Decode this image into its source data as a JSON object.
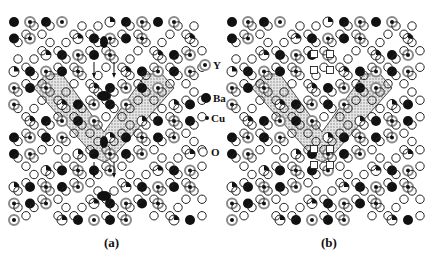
{
  "figure": {
    "panels": [
      {
        "id": "a",
        "caption": "(a)",
        "features": [
          "shaded-v-domain",
          "displacement-arrows",
          "elongated-ba-atoms"
        ]
      },
      {
        "id": "b",
        "caption": "(b)",
        "features": [
          "shaded-v-domain",
          "vacancy-square-markers"
        ]
      }
    ],
    "legend": [
      {
        "symbol": "ringed-dot",
        "label": "Y"
      },
      {
        "symbol": "filled-circle",
        "label": "Ba"
      },
      {
        "symbol": "small-dot",
        "label": "Cu"
      },
      {
        "symbol": "open-circle",
        "label": "O"
      }
    ],
    "colors": {
      "atom_dark": "#111111",
      "ring_gray": "#8a8a8a",
      "domain_shade": "#c8c8c8",
      "outline": "#222222",
      "background": "#ffffff"
    }
  }
}
